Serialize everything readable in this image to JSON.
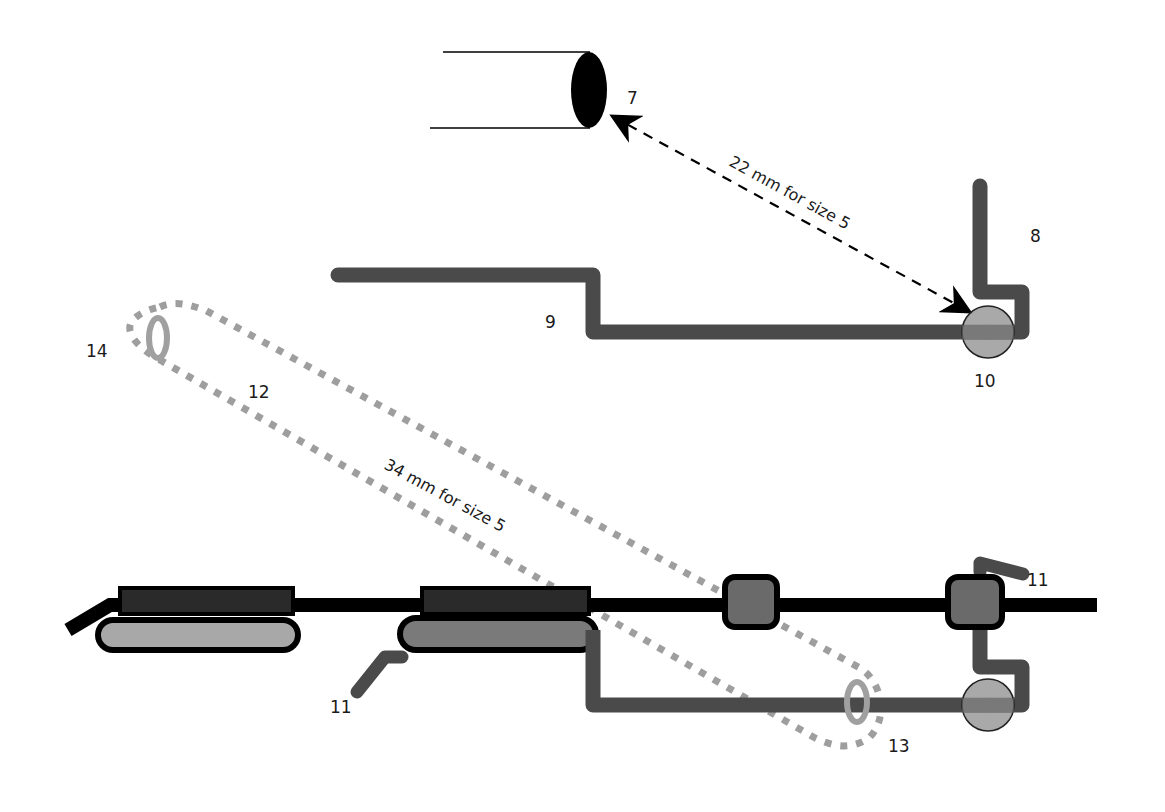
{
  "diagram": {
    "colors": {
      "background": "#ffffff",
      "wire_black": "#000000",
      "wire_dark_gray": "#4a4a4a",
      "pad_light_gray": "#a8a8a8",
      "pad_mid_gray": "#7a7a7a",
      "circle_gray": "#9a9a9a",
      "dotted_outline": "#9e9e9e",
      "oval_ring": "#a0a0a0",
      "text": "#1a1a1a"
    },
    "labels": {
      "l7": "7",
      "l8": "8",
      "l9": "9",
      "l10": "10",
      "l11_top": "11",
      "l11_bottom": "11",
      "l12": "12",
      "l13": "13",
      "l14": "14"
    },
    "dimensions": {
      "upper": "22 mm for size 5",
      "lower": "34 mm for size 5"
    },
    "components": [
      {
        "id": "7",
        "description": "cylinder with black elliptical end"
      },
      {
        "id": "8",
        "description": "vertical bent wire segment"
      },
      {
        "id": "9",
        "description": "stepped horizontal wire"
      },
      {
        "id": "10",
        "description": "gray circular joint"
      },
      {
        "id": "11",
        "description": "angled wire stubs"
      },
      {
        "id": "12",
        "description": "dotted elongated outline"
      },
      {
        "id": "13",
        "description": "small oval ring at right end of outline"
      },
      {
        "id": "14",
        "description": "small oval ring at left end of outline"
      }
    ]
  }
}
